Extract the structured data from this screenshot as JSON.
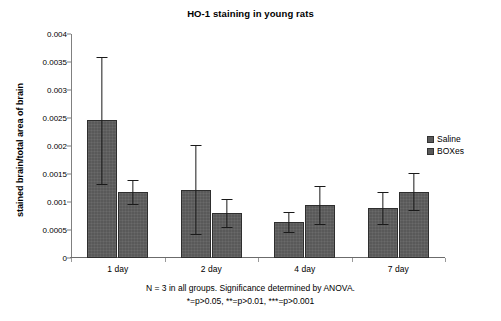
{
  "chart_data": {
    "type": "bar",
    "title": "HO-1 staining in young rats",
    "xlabel": "",
    "ylabel": "stained brain/total area of brain",
    "categories": [
      "1 day",
      "2 day",
      "4 day",
      "7 day"
    ],
    "series": [
      {
        "name": "Saline",
        "color": "#595959",
        "values": [
          0.00246,
          0.00122,
          0.00064,
          0.00089
        ],
        "errors": [
          0.00113,
          0.00079,
          0.00018,
          0.00028
        ]
      },
      {
        "name": "BOXes",
        "color": "#595959",
        "values": [
          0.00118,
          0.0008,
          0.00095,
          0.00118
        ],
        "errors": [
          0.00021,
          0.00025,
          0.00034,
          0.00033
        ]
      }
    ],
    "ylim": [
      0,
      0.004
    ],
    "ytick_labels": [
      "0",
      "0.0005",
      "0.001",
      "0.0015",
      "0.002",
      "0.0025",
      "0.003",
      "0.0035",
      "0.004"
    ],
    "ytick_values": [
      0,
      0.0005,
      0.001,
      0.0015,
      0.002,
      0.0025,
      0.003,
      0.0035,
      0.004
    ],
    "grid": false,
    "legend_position": "right",
    "error_bar_style": "symmetric-caps",
    "annotations": [
      "N = 3 in all groups. Significance determined by ANOVA.",
      "*=p>0.05, **=p>0.01, ***=p>0.001"
    ]
  },
  "legend": {
    "items": [
      {
        "label": "Saline"
      },
      {
        "label": "BOXes"
      }
    ]
  },
  "footnote": {
    "line1": "N = 3 in all groups. Significance determined by ANOVA.",
    "line2": "*=p>0.05, **=p>0.01, ***=p>0.001"
  }
}
